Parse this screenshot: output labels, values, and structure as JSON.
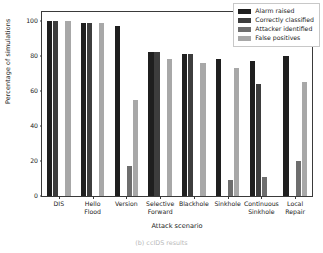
{
  "chart_data": {
    "type": "bar",
    "title": "",
    "xlabel": "Attack scenario",
    "ylabel": "Percentage of simulations",
    "ylim": [
      0,
      105
    ],
    "yticks": [
      0,
      20,
      40,
      60,
      80,
      100
    ],
    "ytick_labels": [
      "0",
      "20",
      "40",
      "60",
      "80",
      "100"
    ],
    "grid": false,
    "legend_position": "upper right",
    "categories": [
      "DIS",
      "Hello\nFlood",
      "Version",
      "Selective\nForward",
      "Blackhole",
      "Sinkhole",
      "Continuous\nSinkhole",
      "Local\nRepair"
    ],
    "series": [
      {
        "name": "Alarm raised",
        "color": "#1f1f1f",
        "values": [
          100,
          99,
          97,
          82,
          81,
          78,
          77,
          80
        ]
      },
      {
        "name": "Correctly classified",
        "color": "#3d3d3d",
        "values": [
          100,
          99,
          0,
          82,
          81,
          0,
          64,
          0
        ]
      },
      {
        "name": "Attacker identified",
        "color": "#6e6e6e",
        "values": [
          0,
          0,
          17,
          0,
          0,
          9,
          11,
          20
        ]
      },
      {
        "name": "False positives",
        "color": "#a8a8a8",
        "values": [
          100,
          99,
          55,
          78,
          76,
          73,
          0,
          65
        ]
      }
    ]
  },
  "legend": {
    "entries": [
      {
        "label": "Alarm raised",
        "color": "#1f1f1f"
      },
      {
        "label": "Correctly classified",
        "color": "#3d3d3d"
      },
      {
        "label": "Attacker identified",
        "color": "#6e6e6e"
      },
      {
        "label": "False positives",
        "color": "#a8a8a8"
      }
    ]
  },
  "caption": {
    "text": "(b) ccIDS results"
  }
}
